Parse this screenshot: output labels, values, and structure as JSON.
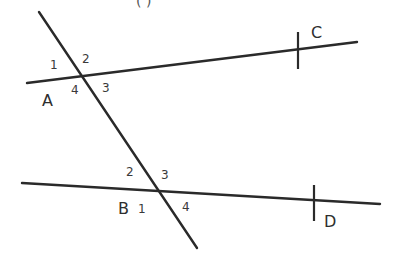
{
  "figure": {
    "top_cropped_text": "( )",
    "lines": {
      "transversal": {
        "x1": 39,
        "y1": 12,
        "x2": 197,
        "y2": 248
      },
      "line_AC": {
        "x1": 27,
        "y1": 83,
        "x2": 357,
        "y2": 42
      },
      "line_BD": {
        "x1": 22,
        "y1": 183,
        "x2": 380,
        "y2": 204
      }
    },
    "ticks": {
      "C": {
        "x1": 298,
        "y1": 32,
        "x2": 298,
        "y2": 69
      },
      "D": {
        "x1": 314,
        "y1": 185,
        "x2": 314,
        "y2": 221
      }
    },
    "points": {
      "A": "A",
      "B": "B",
      "C": "C",
      "D": "D"
    },
    "angles_at_A": {
      "a1": "1",
      "a2": "2",
      "a3": "3",
      "a4": "4"
    },
    "angles_at_B": {
      "b1": "1",
      "b2": "2",
      "b3": "3",
      "b4": "4"
    }
  }
}
